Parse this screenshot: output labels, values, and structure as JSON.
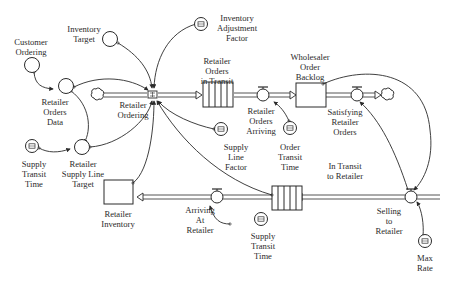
{
  "diagram": {
    "type": "stock-and-flow",
    "stocks": [
      {
        "id": "retailer_orders_in_transit",
        "label": [
          "Retailer",
          "Orders",
          "in Transit"
        ],
        "kind": "conveyor"
      },
      {
        "id": "wholesaler_order_backlog",
        "label": [
          "Wholesaler",
          "Order",
          "Backlog"
        ],
        "kind": "level"
      },
      {
        "id": "in_transit_to_retailer",
        "label": [
          "In Transit",
          "to Retailer"
        ],
        "kind": "conveyor"
      },
      {
        "id": "retailer_inventory",
        "label": [
          "Retailer",
          "Inventory"
        ],
        "kind": "level"
      }
    ],
    "flows": [
      {
        "id": "retailer_ordering",
        "label": [
          "Retailer",
          "Ordering"
        ]
      },
      {
        "id": "retailer_orders_arriving",
        "label": [
          "Retailer",
          "Orders",
          "Arriving"
        ]
      },
      {
        "id": "satisfying_retailer_orders",
        "label": [
          "Satisfying",
          "Retailer",
          "Orders"
        ]
      },
      {
        "id": "selling_to_retailer",
        "label": [
          "Selling",
          "to",
          "Retailer"
        ]
      },
      {
        "id": "arriving_at_retailer",
        "label": [
          "Arriving",
          "At",
          "Retailer"
        ]
      }
    ],
    "auxiliaries": [
      {
        "id": "customer_ordering",
        "label": [
          "Customer",
          "Ordering"
        ]
      },
      {
        "id": "inventory_target",
        "label": [
          "Inventory",
          "Target"
        ]
      },
      {
        "id": "retailer_orders_data",
        "label": [
          "Retailer",
          "Orders",
          "Data"
        ]
      },
      {
        "id": "retailer_supply_line_target",
        "label": [
          "Retailer",
          "Supply Line",
          "Target"
        ]
      }
    ],
    "constants": [
      {
        "id": "inventory_adjustment_factor",
        "label": [
          "Inventory",
          "Adjustment",
          "Factor"
        ]
      },
      {
        "id": "supply_line_factor",
        "label": [
          "Supply",
          "Line",
          "Factor"
        ]
      },
      {
        "id": "order_transit_time",
        "label": [
          "Order",
          "Transit",
          "Time"
        ]
      },
      {
        "id": "supply_transit_time_1",
        "label": [
          "Supply",
          "Transit",
          "Time"
        ]
      },
      {
        "id": "supply_transit_time_2",
        "label": [
          "Supply",
          "Transit",
          "Time"
        ]
      },
      {
        "id": "max_rate",
        "label": [
          "Max",
          "Rate"
        ]
      }
    ],
    "clouds": [
      "source-cloud-retailer-ordering",
      "sink-cloud-satisfying-orders"
    ]
  },
  "labels": {
    "customer_ordering": {
      "l1": "Customer",
      "l2": "Ordering"
    },
    "inventory_target": {
      "l1": "Inventory",
      "l2": "Target"
    },
    "inventory_adjustment_factor": {
      "l1": "Inventory",
      "l2": "Adjustment",
      "l3": "Factor"
    },
    "retailer_orders_data": {
      "l1": "Retailer",
      "l2": "Orders",
      "l3": "Data"
    },
    "retailer_ordering": {
      "l1": "Retailer",
      "l2": "Ordering"
    },
    "retailer_orders_in_transit": {
      "l1": "Retailer",
      "l2": "Orders",
      "l3": "in Transit"
    },
    "retailer_orders_arriving": {
      "l1": "Retailer",
      "l2": "Orders",
      "l3": "Arriving"
    },
    "wholesaler_order_backlog": {
      "l1": "Wholesaler",
      "l2": "Order",
      "l3": "Backlog"
    },
    "satisfying_retailer_orders": {
      "l1": "Satisfying",
      "l2": "Retailer",
      "l3": "Orders"
    },
    "supply_transit_time_1": {
      "l1": "Supply",
      "l2": "Transit",
      "l3": "Time"
    },
    "retailer_supply_line_target": {
      "l1": "Retailer",
      "l2": "Supply Line",
      "l3": "Target"
    },
    "supply_line_factor": {
      "l1": "Supply",
      "l2": "Line",
      "l3": "Factor"
    },
    "order_transit_time": {
      "l1": "Order",
      "l2": "Transit",
      "l3": "Time"
    },
    "in_transit_to_retailer": {
      "l1": "In Transit",
      "l2": "to Retailer"
    },
    "retailer_inventory": {
      "l1": "Retailer",
      "l2": "Inventory"
    },
    "arriving_at_retailer": {
      "l1": "Arriving",
      "l2": "At",
      "l3": "Retailer"
    },
    "supply_transit_time_2": {
      "l1": "Supply",
      "l2": "Transit",
      "l3": "Time"
    },
    "selling_to_retailer": {
      "l1": "Selling",
      "l2": "to",
      "l3": "Retailer"
    },
    "max_rate": {
      "l1": "Max",
      "l2": "Rate"
    }
  },
  "colors": {
    "stroke": "#2a2a2a",
    "pipe": "#555555",
    "background": "#ffffff"
  }
}
